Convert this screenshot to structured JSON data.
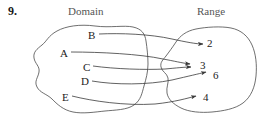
{
  "figure": {
    "problem_number": "9.",
    "type": "arrow-mapping-diagram"
  },
  "headings": {
    "domain": "Domain",
    "range": "Range"
  },
  "domain_set": {
    "elements": [
      {
        "id": "A",
        "label": "A"
      },
      {
        "id": "B",
        "label": "B"
      },
      {
        "id": "C",
        "label": "C"
      },
      {
        "id": "D",
        "label": "D"
      },
      {
        "id": "E",
        "label": "E"
      }
    ]
  },
  "range_set": {
    "elements": [
      {
        "id": "2",
        "label": "2"
      },
      {
        "id": "3",
        "label": "3"
      },
      {
        "id": "6",
        "label": "6"
      },
      {
        "id": "4",
        "label": "4"
      }
    ]
  },
  "mappings": [
    {
      "from": "B",
      "to": "2"
    },
    {
      "from": "A",
      "to": "3"
    },
    {
      "from": "C",
      "to": "3"
    },
    {
      "from": "D",
      "to": "6"
    },
    {
      "from": "E",
      "to": "4"
    }
  ],
  "colors": {
    "ink": "#2a2a2a",
    "heading": "#555555",
    "background": "#ffffff"
  }
}
